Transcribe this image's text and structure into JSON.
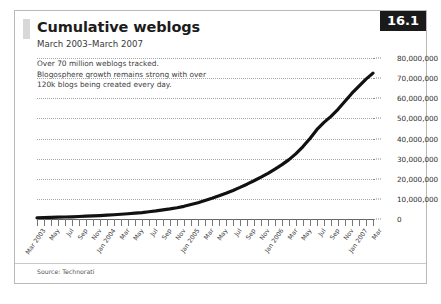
{
  "figure": {
    "title": "Cumulative weblogs",
    "subtitle": "March 2003–March 2007",
    "badge": "16.1",
    "caption_lines": [
      "Over 70 million weblogs tracked.",
      "Blogosphere growth remains strong with over",
      "120k blogs being created every day."
    ],
    "source": "Source: Technorati",
    "accent_color": "#d8d8d8",
    "badge_bg": "#1a1a1a",
    "badge_fg": "#ffffff",
    "line_color": "#111111",
    "grid_color": "#a8a8a8"
  },
  "chart_data": {
    "type": "line",
    "title": "Cumulative weblogs",
    "subtitle": "March 2003–March 2007",
    "xlabel": "",
    "ylabel": "",
    "ylim": [
      0,
      80000000
    ],
    "grid": true,
    "legend": "none",
    "ytick_labels": [
      "0",
      "10,000,000",
      "20,000,000",
      "30,000,000",
      "40,000,000",
      "50,000,000",
      "60,000,000",
      "70,000,000",
      "80,000,000"
    ],
    "ytick_values": [
      0,
      10000000,
      20000000,
      30000000,
      40000000,
      50000000,
      60000000,
      70000000,
      80000000
    ],
    "xtick_labels": [
      "Mar 2003",
      "May",
      "Jul",
      "Sep",
      "Nov",
      "Jan 2004",
      "Mar",
      "May",
      "Jul",
      "Sep",
      "Nov",
      "Jan 2005",
      "Mar",
      "May",
      "Jul",
      "Sep",
      "Nov",
      "Jan 2006",
      "Mar",
      "May",
      "Jul",
      "Sep",
      "Nov",
      "Jan 2007",
      "Mar"
    ],
    "x": [
      "Mar 2003",
      "Apr 2003",
      "May 2003",
      "Jun 2003",
      "Jul 2003",
      "Aug 2003",
      "Sep 2003",
      "Oct 2003",
      "Nov 2003",
      "Dec 2003",
      "Jan 2004",
      "Feb 2004",
      "Mar 2004",
      "Apr 2004",
      "May 2004",
      "Jun 2004",
      "Jul 2004",
      "Aug 2004",
      "Sep 2004",
      "Oct 2004",
      "Nov 2004",
      "Dec 2004",
      "Jan 2005",
      "Feb 2005",
      "Mar 2005",
      "Apr 2005",
      "May 2005",
      "Jun 2005",
      "Jul 2005",
      "Aug 2005",
      "Sep 2005",
      "Oct 2005",
      "Nov 2005",
      "Dec 2005",
      "Jan 2006",
      "Feb 2006",
      "Mar 2006",
      "Apr 2006",
      "May 2006",
      "Jun 2006",
      "Jul 2006",
      "Aug 2006",
      "Sep 2006",
      "Oct 2006",
      "Nov 2006",
      "Dec 2006",
      "Jan 2007",
      "Feb 2007",
      "Mar 2007"
    ],
    "series": [
      {
        "name": "Cumulative weblogs",
        "values": [
          600000,
          700000,
          800000,
          900000,
          1000000,
          1100000,
          1250000,
          1400000,
          1550000,
          1700000,
          1900000,
          2100000,
          2350000,
          2600000,
          2900000,
          3200000,
          3600000,
          4000000,
          4500000,
          5000000,
          5600000,
          6300000,
          7200000,
          8100000,
          9200000,
          10300000,
          11500000,
          12800000,
          14200000,
          15700000,
          17300000,
          19000000,
          20800000,
          22700000,
          24800000,
          27000000,
          29500000,
          32500000,
          36000000,
          40000000,
          44500000,
          48000000,
          51000000,
          54500000,
          58500000,
          62500000,
          66000000,
          69500000,
          72500000
        ]
      }
    ]
  }
}
